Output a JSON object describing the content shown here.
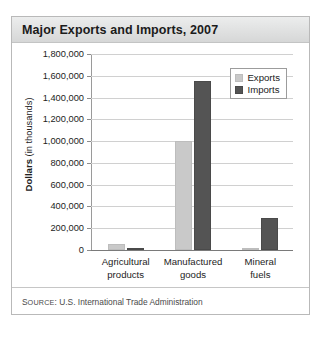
{
  "card": {
    "title": "Major Exports and Imports, 2007",
    "source_prefix": "S",
    "source_smallcaps": "OURCE",
    "source_rest": ": U.S. International Trade Administration",
    "source_full": "SOURCE: U.S. International Trade Administration"
  },
  "colors": {
    "exports": "#c9c9c9",
    "imports": "#545454",
    "grid": "#d0d0d0",
    "axis": "#7a7a7a",
    "title_bar": "#e2e3e3",
    "border": "#b9b9b9"
  },
  "chart_data": {
    "type": "bar",
    "title": "Major Exports and Imports, 2007",
    "xlabel": "",
    "ylabel": "Dollars (in thousands)",
    "ylabel_bold_part": "Dollars",
    "ylabel_rest": " (in thousands)",
    "categories": [
      "Agricultural products",
      "Manufactured goods",
      "Mineral fuels"
    ],
    "category_lines": [
      [
        "Agricultural",
        "products"
      ],
      [
        "Manufactured",
        "goods"
      ],
      [
        "Mineral",
        "fuels"
      ]
    ],
    "series": [
      {
        "name": "Exports",
        "color": "#c9c9c9",
        "values": [
          55000,
          1000000,
          20000
        ]
      },
      {
        "name": "Imports",
        "color": "#545454",
        "values": [
          22000,
          1550000,
          290000
        ]
      }
    ],
    "ylim": [
      0,
      1800000
    ],
    "ytick_step": 200000,
    "ytick_labels": [
      "1,800,000",
      "1,600,000",
      "1,400,000",
      "1,200,000",
      "1,000,000",
      "800,000",
      "600,000",
      "400,000",
      "200,000",
      "0"
    ],
    "ytick_values": [
      1800000,
      1600000,
      1400000,
      1200000,
      1000000,
      800000,
      600000,
      400000,
      200000,
      0
    ],
    "grid": true,
    "legend_position": "top-right"
  }
}
